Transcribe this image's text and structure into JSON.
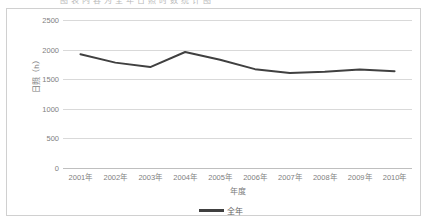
{
  "caption": {
    "clipped_text": "图 表 内 容 为 全 年 日 照 时 数 统 计 图"
  },
  "chart_data": {
    "type": "line",
    "title": "",
    "xlabel": "年度",
    "ylabel": "日照（h）",
    "categories": [
      "2001年",
      "2002年",
      "2003年",
      "2004年",
      "2005年",
      "2006年",
      "2007年",
      "2008年",
      "2009年",
      "2010年"
    ],
    "series": [
      {
        "name": "全年",
        "color": "#404040",
        "values": [
          1920,
          1780,
          1705,
          1960,
          1830,
          1670,
          1605,
          1625,
          1665,
          1635
        ]
      }
    ],
    "yticks": [
      0,
      500,
      1000,
      1500,
      2000,
      2500
    ],
    "ylim": [
      0,
      2500
    ],
    "grid": "horizontal",
    "legend_position": "bottom",
    "line_color": "#404040",
    "grid_color": "#d9d9d9",
    "axis_text_color": "#808080",
    "plot_background": "#ffffff",
    "border_color": "#d0d0d0"
  },
  "legend": {
    "entries": [
      {
        "label": "全年",
        "swatch": "line-swatch"
      }
    ]
  }
}
